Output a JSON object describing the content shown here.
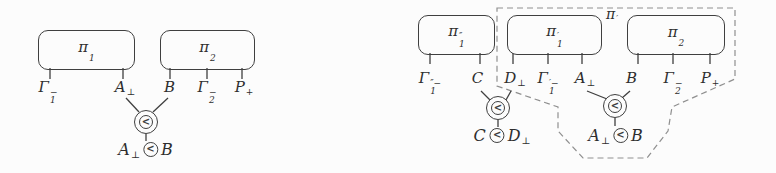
{
  "colors": {
    "ink": "#3f3f3f",
    "dash": "#8f8f8f",
    "background": "#fcfcfc",
    "text": "#2e2e2e"
  },
  "symbols": {
    "before": "<"
  },
  "left": {
    "boxes": [
      {
        "base": "π",
        "sub": "1",
        "sup": ""
      },
      {
        "base": "π",
        "sub": "2",
        "sup": ""
      }
    ],
    "ports": [
      {
        "base": "Γ",
        "sub": "1",
        "sup": "−"
      },
      {
        "base": "A",
        "sub": "",
        "sup": "⊥"
      },
      {
        "base": "B",
        "sub": "",
        "sup": ""
      },
      {
        "base": "Γ",
        "sub": "2",
        "sup": "−"
      },
      {
        "base": "P",
        "sub": "",
        "sup": "+"
      }
    ],
    "conclusion": {
      "l": {
        "base": "A",
        "sub": "",
        "sup": "⊥"
      },
      "r": {
        "base": "B",
        "sub": "",
        "sup": ""
      }
    }
  },
  "right": {
    "boxes": [
      {
        "base": "π",
        "sub": "1",
        "sup": "″"
      },
      {
        "base": "π",
        "sub": "1",
        "sup": "′"
      },
      {
        "base": "π",
        "sub": "2",
        "sup": ""
      }
    ],
    "region_label": {
      "base": "π",
      "sub": "",
      "sup": "′"
    },
    "ports": [
      {
        "base": "Γ",
        "sub": "1",
        "sup": "″−"
      },
      {
        "base": "C",
        "sub": "",
        "sup": ""
      },
      {
        "base": "D",
        "sub": "",
        "sup": "⊥"
      },
      {
        "base": "Γ",
        "sub": "1",
        "sup": "′−"
      },
      {
        "base": "A",
        "sub": "",
        "sup": "⊥"
      },
      {
        "base": "B",
        "sub": "",
        "sup": ""
      },
      {
        "base": "Γ",
        "sub": "2",
        "sup": "−"
      },
      {
        "base": "P",
        "sub": "",
        "sup": "+"
      }
    ],
    "conclusions": [
      {
        "l": {
          "base": "C",
          "sub": "",
          "sup": ""
        },
        "r": {
          "base": "D",
          "sub": "",
          "sup": "⊥"
        }
      },
      {
        "l": {
          "base": "A",
          "sub": "",
          "sup": "⊥"
        },
        "r": {
          "base": "B",
          "sub": "",
          "sup": ""
        }
      }
    ]
  }
}
